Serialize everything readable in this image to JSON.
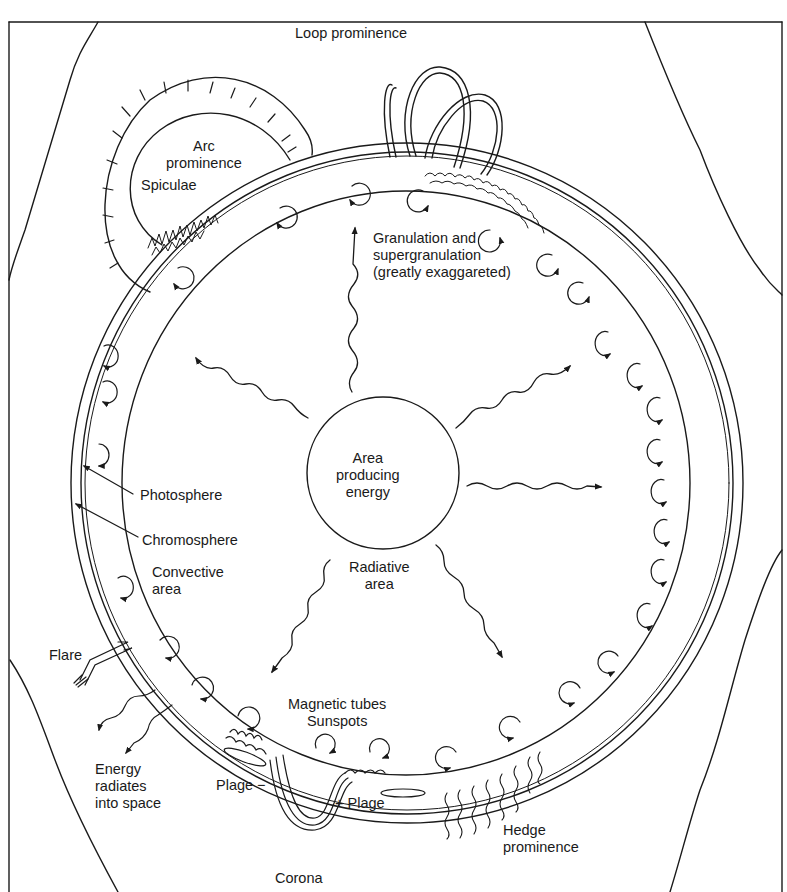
{
  "diagram": {
    "colors": {
      "ink": "#1a1a1a",
      "background": "#ffffff"
    },
    "labels": {
      "loop_prominence": "Loop prominence",
      "arc_prominence": "Arc\nprominence",
      "spiculae": "Spiculae",
      "granulation": "Granulation and\nsupergranulation\n(greatly exaggareted)",
      "core": "Area\nproducing\nenergy",
      "photosphere": "Photosphere",
      "chromosphere": "Chromosphere",
      "convective_area": "Convective\narea",
      "radiative_area": "Radiative\narea",
      "flare": "Flare",
      "magnetic_tubes": "Magnetic tubes\nSunspots",
      "energy_radiates": "Energy\nradiates\ninto space",
      "plage_minus": "Plage  −",
      "plage_plus": "+  Plage",
      "hedge_prominence": "Hedge\nprominence",
      "corona": "Corona"
    }
  }
}
